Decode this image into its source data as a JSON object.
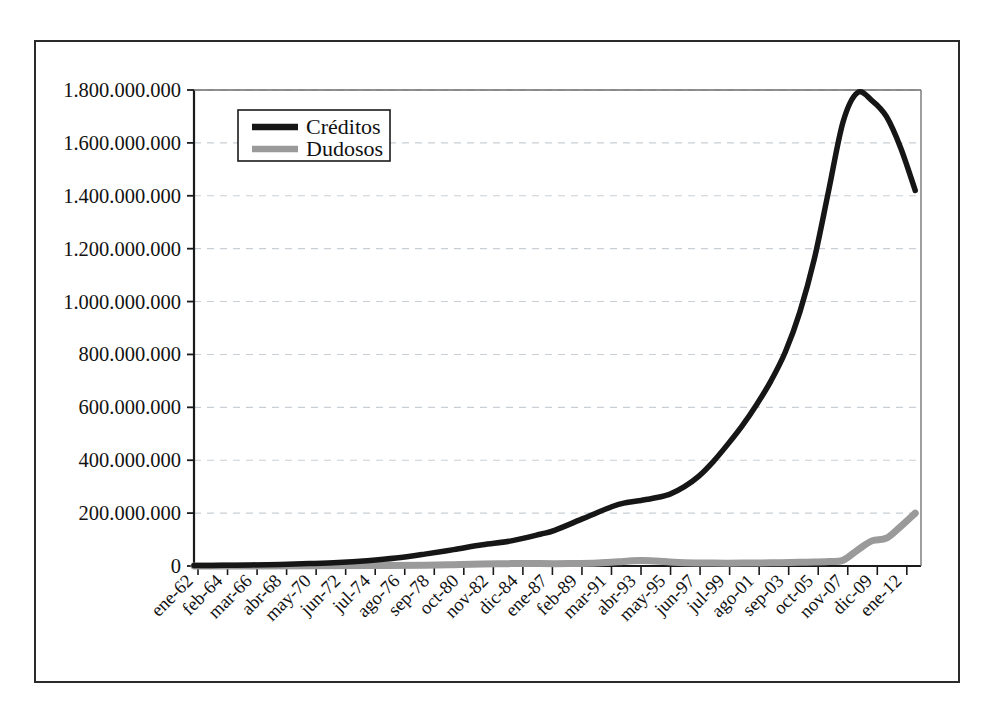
{
  "figure": {
    "background_color": "#ffffff",
    "frame_color": "#2b2b2b",
    "axis_color": "#1a1a1a",
    "gridline_color": "#c9cfd6"
  },
  "legend": {
    "position": "top-left-inside",
    "border_color": "#1a1a1a",
    "entries": [
      {
        "label": "Créditos",
        "color": "#161616"
      },
      {
        "label": "Dudosos",
        "color": "#9a9a9a"
      }
    ]
  },
  "chart_data": {
    "type": "line",
    "title": "",
    "xlabel": "",
    "ylabel": "",
    "grid": true,
    "legend_position": "upper left",
    "ylim": [
      0,
      1800000000
    ],
    "yticks": [
      0,
      200000000,
      400000000,
      600000000,
      800000000,
      1000000000,
      1200000000,
      1400000000,
      1600000000,
      1800000000
    ],
    "ytick_labels": [
      "0",
      "200.000.000",
      "400.000.000",
      "600.000.000",
      "800.000.000",
      "1.000.000.000",
      "1.200.000.000",
      "1.400.000.000",
      "1.600.000.000",
      "1.800.000.000"
    ],
    "xtick_labels": [
      "ene-62",
      "feb-64",
      "mar-66",
      "abr-68",
      "may-70",
      "jun-72",
      "jul-74",
      "ago-76",
      "sep-78",
      "oct-80",
      "nov-82",
      "dic-84",
      "ene-87",
      "feb-89",
      "mar-91",
      "abr-93",
      "may-95",
      "jun-97",
      "jul-99",
      "ago-01",
      "sep-03",
      "oct-05",
      "nov-07",
      "dic-09",
      "ene-12"
    ],
    "xtick_rotation": 45,
    "series": [
      {
        "name": "Créditos",
        "color": "#161616",
        "x": [
          1962,
          1964,
          1966,
          1968,
          1970,
          1972,
          1974,
          1976,
          1978,
          1980,
          1982,
          1984,
          1986,
          1987,
          1989,
          1991,
          1992,
          1993,
          1994,
          1995,
          1996,
          1997,
          1998,
          1999,
          2000,
          2001,
          2002,
          2003,
          2004,
          2005,
          2006,
          2007,
          2008,
          2009,
          2010,
          2011,
          2012
        ],
        "values": [
          1500000,
          2500000,
          4000000,
          6000000,
          9000000,
          13000000,
          20000000,
          30000000,
          45000000,
          62000000,
          80000000,
          95000000,
          120000000,
          135000000,
          180000000,
          225000000,
          240000000,
          248000000,
          258000000,
          272000000,
          300000000,
          340000000,
          395000000,
          460000000,
          530000000,
          610000000,
          700000000,
          810000000,
          960000000,
          1160000000,
          1420000000,
          1680000000,
          1790000000,
          1760000000,
          1700000000,
          1580000000,
          1420000000
        ]
      },
      {
        "name": "Dudosos",
        "color": "#9a9a9a",
        "x": [
          1962,
          1966,
          1970,
          1974,
          1978,
          1980,
          1982,
          1984,
          1986,
          1988,
          1990,
          1992,
          1993,
          1994,
          1995,
          1996,
          1998,
          2000,
          2002,
          2004,
          2005,
          2006,
          2007,
          2008,
          2009,
          2010,
          2011,
          2012
        ],
        "values": [
          200000,
          400000,
          800000,
          1500000,
          3000000,
          5000000,
          8000000,
          9000000,
          9000000,
          9000000,
          11000000,
          18000000,
          21000000,
          19000000,
          15000000,
          12000000,
          11000000,
          11000000,
          12000000,
          14000000,
          15000000,
          17000000,
          22000000,
          60000000,
          95000000,
          105000000,
          150000000,
          200000000
        ]
      }
    ],
    "annotations": {
      "peak_creditos_value": 1800000000,
      "peak_creditos_period": "nov-07",
      "end_creditos_value": 1420000000,
      "end_dudosos_value": 200000000
    }
  }
}
